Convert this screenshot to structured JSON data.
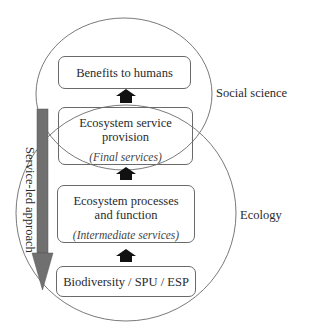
{
  "diagram": {
    "domains": [
      {
        "id": "social",
        "label": "Social science"
      },
      {
        "id": "ecology",
        "label": "Ecology"
      }
    ],
    "boxes": [
      {
        "id": "benefits",
        "label": "Benefits to humans",
        "sublabel": ""
      },
      {
        "id": "provision",
        "label": "Ecosystem service provision",
        "label_line1": "Ecosystem service",
        "label_line2": "provision",
        "sublabel": "(Final services)"
      },
      {
        "id": "processes",
        "label": "Ecosystem processes and function",
        "label_line1": "Ecosystem processes",
        "label_line2": "and function",
        "sublabel": "(Intermediate services)"
      },
      {
        "id": "biodiversity",
        "label": "Biodiversity / SPU / ESP",
        "sublabel": ""
      }
    ],
    "flow_arrows": [
      {
        "from": "biodiversity",
        "to": "processes",
        "direction": "up"
      },
      {
        "from": "processes",
        "to": "provision",
        "direction": "up"
      },
      {
        "from": "provision",
        "to": "benefits",
        "direction": "up"
      }
    ],
    "approach_arrow": {
      "label": "Service-led approach",
      "direction": "down",
      "color": "#707070"
    },
    "colors": {
      "outline": "#6a6a6a",
      "flow_arrow": "#111111",
      "approach_arrow": "#707070",
      "background": "#ffffff"
    }
  }
}
